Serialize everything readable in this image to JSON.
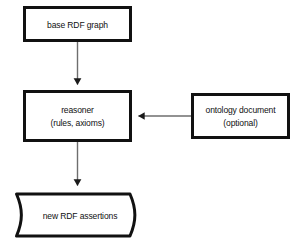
{
  "diagram": {
    "background_color": "#ffffff",
    "stroke_color": "#111111",
    "fill_color": "#ffffff",
    "connector_color": "#666666",
    "nodes": [
      {
        "id": "base_rdf_graph",
        "shape": "rectangle",
        "lines": [
          "base RDF graph"
        ],
        "x": 24,
        "y": 7,
        "w": 107,
        "h": 34
      },
      {
        "id": "reasoner",
        "shape": "rectangle",
        "lines": [
          "reasoner",
          "(rules, axioms)"
        ],
        "x": 24,
        "y": 91,
        "w": 107,
        "h": 50
      },
      {
        "id": "ontology_document",
        "shape": "rectangle",
        "lines": [
          "ontology document",
          "(optional)"
        ],
        "x": 192,
        "y": 94,
        "w": 97,
        "h": 44
      },
      {
        "id": "new_rdf_assertions",
        "shape": "tape",
        "lines": [
          "new RDF assertions"
        ],
        "x": 15,
        "y": 192,
        "w": 130,
        "h": 46
      }
    ],
    "connectors": [
      {
        "id": "base_to_reasoner",
        "from": "base_rdf_graph",
        "to": "reasoner",
        "direction": "down",
        "arrowhead": "filled-triangle"
      },
      {
        "id": "ontology_to_reasoner",
        "from": "ontology_document",
        "to": "reasoner",
        "direction": "left",
        "arrowhead": "filled-triangle"
      },
      {
        "id": "reasoner_to_assertions",
        "from": "reasoner",
        "to": "new_rdf_assertions",
        "direction": "down",
        "arrowhead": "filled-triangle"
      }
    ]
  }
}
